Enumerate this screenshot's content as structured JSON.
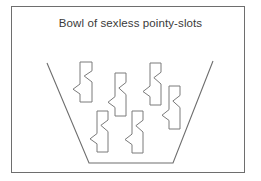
{
  "diagram": {
    "title": "Bowl of sexless pointy-slots",
    "colors": {
      "stroke": "#7a7a7a",
      "frame": "#6e6e6e",
      "text": "#3a3a3a",
      "background": "#ffffff"
    },
    "bowl": {
      "label": "bowl",
      "points": [
        [
          47,
          63
        ],
        [
          89,
          163
        ],
        [
          173,
          163
        ],
        [
          213,
          61
        ]
      ]
    },
    "pieces": [
      {
        "label": "pointy-slot 1",
        "x": 80,
        "y": 62,
        "w": 12,
        "h": 40
      },
      {
        "label": "pointy-slot 2",
        "x": 115,
        "y": 73,
        "w": 11,
        "h": 43
      },
      {
        "label": "pointy-slot 3",
        "x": 150,
        "y": 63,
        "w": 11,
        "h": 42
      },
      {
        "label": "pointy-slot 4",
        "x": 169,
        "y": 86,
        "w": 11,
        "h": 43
      },
      {
        "label": "pointy-slot 5",
        "x": 97,
        "y": 111,
        "w": 11,
        "h": 41
      },
      {
        "label": "pointy-slot 6",
        "x": 132,
        "y": 111,
        "w": 11,
        "h": 42
      }
    ]
  }
}
